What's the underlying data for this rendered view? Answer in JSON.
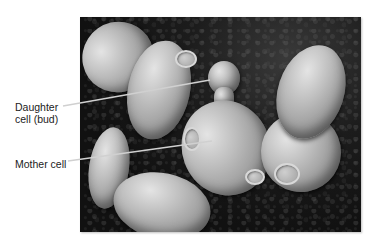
{
  "figure": {
    "type": "scanning-electron-micrograph",
    "labels": [
      {
        "id": "daughter",
        "line1": "Daughter",
        "line2": "cell (bud)"
      },
      {
        "id": "mother",
        "line1": "Mother cell"
      }
    ],
    "colors": {
      "background": "#ffffff",
      "label_text": "#222222",
      "leader_line": "#cccccc",
      "photo_background": "#111111"
    }
  }
}
